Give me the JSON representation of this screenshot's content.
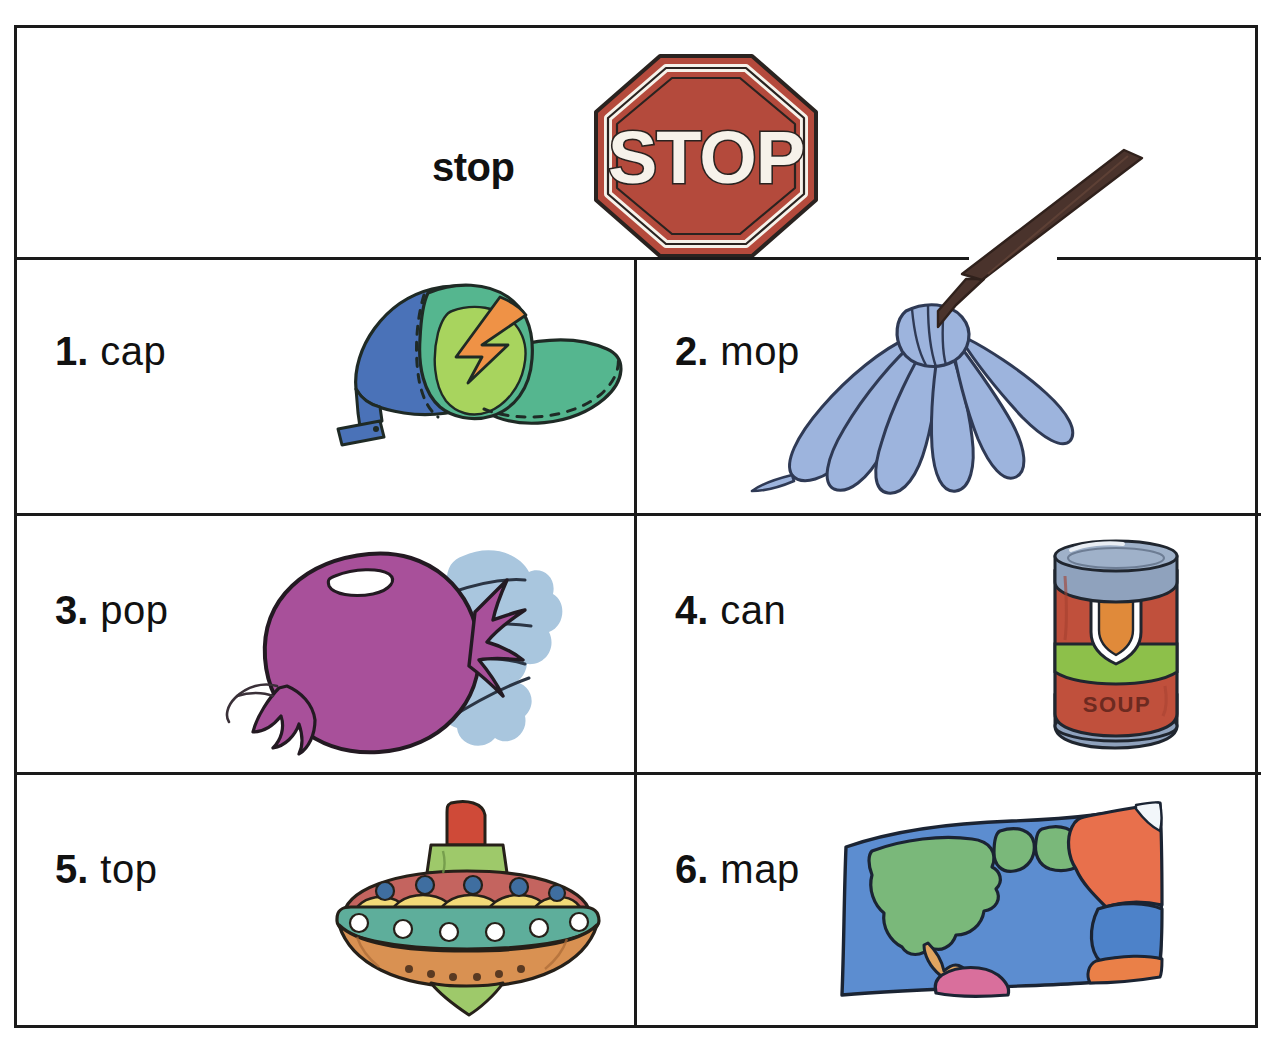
{
  "worksheet": {
    "header": {
      "word": "stop",
      "icon": "stop-sign-icon",
      "sign_text": "STOP"
    },
    "items": [
      {
        "number": "1.",
        "word": "cap",
        "icon": "baseball-cap-icon"
      },
      {
        "number": "2.",
        "word": "mop",
        "icon": "mop-icon"
      },
      {
        "number": "3.",
        "word": "pop",
        "icon": "popping-balloon-icon"
      },
      {
        "number": "4.",
        "word": "can",
        "icon": "soup-can-icon",
        "label_text": "SOUP"
      },
      {
        "number": "5.",
        "word": "top",
        "icon": "spinning-top-icon"
      },
      {
        "number": "6.",
        "word": "map",
        "icon": "world-map-icon"
      }
    ]
  },
  "colors": {
    "border": "#1a1a1a",
    "ink": "#111111",
    "sign_red": "#b44a3c",
    "sign_white": "#f6f2ea",
    "cap_blue": "#4a72b8",
    "cap_teal": "#55b68f",
    "cap_lightgreen": "#a8d45e",
    "cap_orange": "#ef9246",
    "mop_handle": "#4a332c",
    "mop_blue": "#9db4dd",
    "balloon_purple": "#a8509a",
    "burst_blue": "#a9c6de",
    "can_red": "#c0503c",
    "can_metal": "#8fa2bd",
    "can_green": "#8dc04a",
    "can_orange": "#e08a3a",
    "top_red": "#cf4a38",
    "top_rose": "#c4645f",
    "top_teal": "#5eae9b",
    "top_yellow": "#f2da78",
    "top_tan": "#d99152",
    "top_green": "#9ec96a",
    "map_ocean": "#5c8dd0",
    "map_land_green": "#7ab87a",
    "map_land_orange": "#e8704c",
    "map_pink": "#d96f9c",
    "map_tan": "#e0a460"
  }
}
